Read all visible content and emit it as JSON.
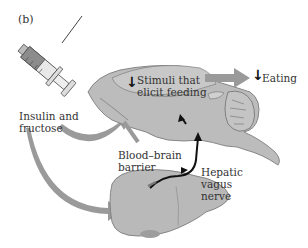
{
  "panel_label": "(b)",
  "labels": {
    "injection": [
      "Insulin and",
      "fructose"
    ],
    "stimuli": [
      "Stimuli that",
      "elicit feeding"
    ],
    "eating": "Eating",
    "barrier": [
      "Blood–brain",
      "barrier"
    ],
    "nerve": [
      "Hepatic",
      "vagus",
      "nerve"
    ]
  },
  "indicators": {
    "stimuli_direction": "↓",
    "eating_direction": "↓"
  },
  "colors": {
    "organ_fill": "#b9b9b9",
    "organ_stroke": "#7d7d7d",
    "arrow_fill": "#9a9a9a",
    "nerve": "#111111",
    "syringe_fluid": "#8c8c8c",
    "text": "#333333"
  }
}
